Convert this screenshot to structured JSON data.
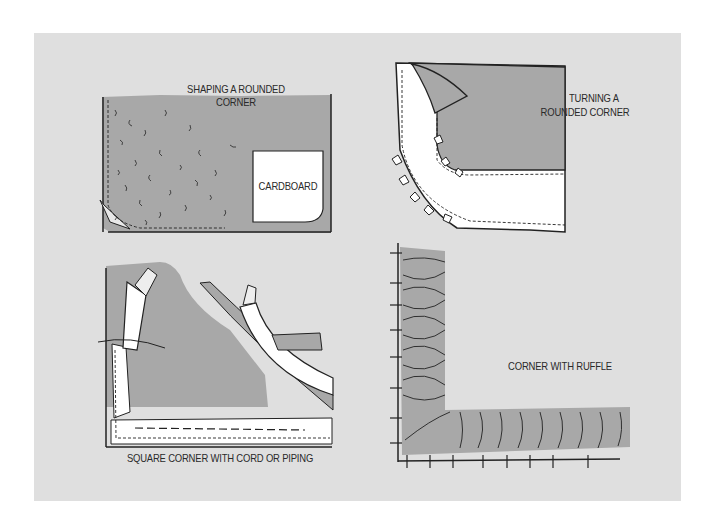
{
  "figure": {
    "background": "#dfdfdf",
    "shape_fill": "#a9a9a9",
    "line_color": "#222222",
    "panels": [
      {
        "id": "shaping-rounded-corner",
        "caption_lines": [
          "SHAPING A ROUNDED",
          "CORNER"
        ],
        "inner_label": "CARDBOARD"
      },
      {
        "id": "turning-rounded-corner",
        "caption_lines": [
          "TURNING A",
          "ROUNDED CORNER"
        ]
      },
      {
        "id": "square-corner-cord",
        "caption": "SQUARE CORNER WITH CORD OR PIPING"
      },
      {
        "id": "corner-ruffle",
        "caption": "CORNER WITH RUFFLE"
      }
    ]
  }
}
